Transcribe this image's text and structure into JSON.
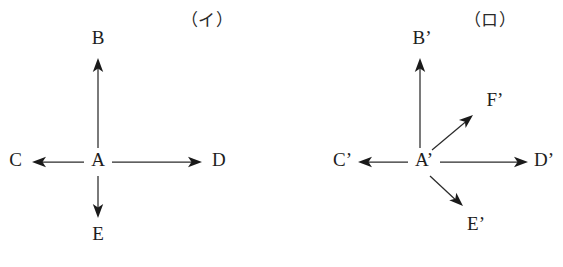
{
  "figure": {
    "background_color": "#ffffff",
    "ink_color": "#1d1d1d",
    "line_color": "#2b2b2b",
    "width": 563,
    "height": 267
  },
  "panels": [
    {
      "id": "panel-i",
      "label": "（イ）",
      "label_x": 207,
      "label_y": 22,
      "origin_label": "A",
      "origin_x": 98,
      "origin_y": 162,
      "vectors": [
        {
          "name": "vector-b",
          "label": "B",
          "direction": "up",
          "line": {
            "x1": 98,
            "y1": 148,
            "x2": 98,
            "y2": 62
          },
          "head": {
            "x": 98,
            "y": 58,
            "angle": -90
          },
          "label_x": 98,
          "label_y": 40,
          "label_anchor": "middle"
        },
        {
          "name": "vector-c",
          "label": "C",
          "direction": "left",
          "line": {
            "x1": 84,
            "y1": 162,
            "x2": 36,
            "y2": 162
          },
          "head": {
            "x": 32,
            "y": 162,
            "angle": 180
          },
          "label_x": 22,
          "label_y": 162,
          "label_anchor": "end"
        },
        {
          "name": "vector-d",
          "label": "D",
          "direction": "right",
          "line": {
            "x1": 112,
            "y1": 162,
            "x2": 198,
            "y2": 162
          },
          "head": {
            "x": 202,
            "y": 162,
            "angle": 0
          },
          "label_x": 212,
          "label_y": 162,
          "label_anchor": "start"
        },
        {
          "name": "vector-e",
          "label": "E",
          "direction": "down",
          "line": {
            "x1": 98,
            "y1": 176,
            "x2": 98,
            "y2": 214
          },
          "head": {
            "x": 98,
            "y": 218,
            "angle": 90
          },
          "label_x": 98,
          "label_y": 236,
          "label_anchor": "middle"
        }
      ]
    },
    {
      "id": "panel-ro",
      "label": "（ロ）",
      "label_x": 490,
      "label_y": 22,
      "origin_label": "A’",
      "origin_x": 424,
      "origin_y": 162,
      "vectors": [
        {
          "name": "vector-b-prime",
          "label": "B’",
          "direction": "up",
          "line": {
            "x1": 420,
            "y1": 148,
            "x2": 420,
            "y2": 62
          },
          "head": {
            "x": 420,
            "y": 58,
            "angle": -90
          },
          "label_x": 422,
          "label_y": 40,
          "label_anchor": "middle"
        },
        {
          "name": "vector-c-prime",
          "label": "C’",
          "direction": "left",
          "line": {
            "x1": 408,
            "y1": 162,
            "x2": 362,
            "y2": 162
          },
          "head": {
            "x": 358,
            "y": 162,
            "angle": 180
          },
          "label_x": 352,
          "label_y": 162,
          "label_anchor": "end"
        },
        {
          "name": "vector-d-prime",
          "label": "D’",
          "direction": "right",
          "line": {
            "x1": 440,
            "y1": 162,
            "x2": 524,
            "y2": 162
          },
          "head": {
            "x": 528,
            "y": 162,
            "angle": 0
          },
          "label_x": 534,
          "label_y": 162,
          "label_anchor": "start"
        },
        {
          "name": "vector-e-prime",
          "label": "E’",
          "direction": "down-right",
          "line": {
            "x1": 430,
            "y1": 176,
            "x2": 459,
            "y2": 203
          },
          "head": {
            "x": 463,
            "y": 206,
            "angle": 43
          },
          "label_x": 476,
          "label_y": 226,
          "label_anchor": "middle"
        },
        {
          "name": "vector-f-prime",
          "label": "F’",
          "direction": "up-right",
          "line": {
            "x1": 432,
            "y1": 150,
            "x2": 469,
            "y2": 119
          },
          "head": {
            "x": 473,
            "y": 115,
            "angle": -40
          },
          "label_x": 495,
          "label_y": 102,
          "label_anchor": "middle"
        }
      ]
    }
  ]
}
